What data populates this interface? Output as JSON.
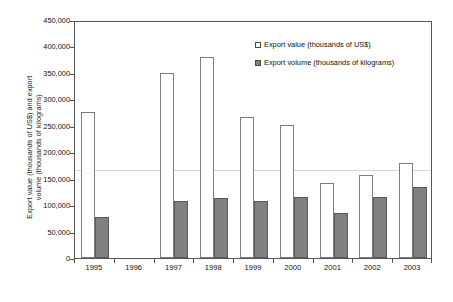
{
  "chart_data": {
    "type": "bar",
    "title": "",
    "xlabel": "",
    "ylabel_line1": "Export value (thousands of US$) and export",
    "ylabel_line2": "volume (thousands of kilograms)",
    "categories": [
      "1995",
      "1996",
      "1997",
      "1998",
      "1999",
      "2000",
      "2001",
      "2002",
      "2003"
    ],
    "series": [
      {
        "name": "Export value (thousands of US$)",
        "color": "#ffffff",
        "values": [
          276000,
          0,
          349000,
          380000,
          266000,
          252000,
          142000,
          157000,
          180000
        ]
      },
      {
        "name": "Export volume (thousands of kilograms)",
        "color": "#808080",
        "values": [
          77000,
          0,
          108000,
          113000,
          107000,
          116000,
          85000,
          115000,
          135000
        ]
      }
    ],
    "ylim": [
      0,
      450000
    ],
    "ytick_values": [
      0,
      50000,
      100000,
      150000,
      200000,
      250000,
      300000,
      350000,
      400000,
      450000
    ],
    "ytick_labels": [
      "0",
      "50,000",
      "100,000",
      "150,000",
      "200,000",
      "250,000",
      "300,000",
      "350,000",
      "400,000",
      "450,000"
    ],
    "grid": "single-horizontal-at-170000",
    "gridline_values": [
      170000
    ],
    "legend_position": "upper-right-inside"
  },
  "legend": {
    "entries": [
      {
        "label": "Export value (thousands of US$)",
        "swatch": "open-square-swatch"
      },
      {
        "label": "Export volume (thousands of kilograms)",
        "swatch": "filled-square-swatch"
      }
    ]
  }
}
